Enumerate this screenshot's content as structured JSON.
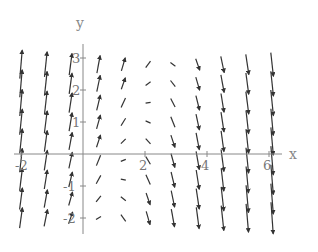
{
  "chart_data": {
    "type": "vector_field",
    "title": "",
    "xlabel": "x",
    "ylabel": "y",
    "xlim": [
      -2.2,
      6.4
    ],
    "ylim": [
      -2.4,
      3.3
    ],
    "x_ticks": [
      -2,
      2,
      4,
      6
    ],
    "y_ticks": [
      -2,
      -1,
      1,
      2,
      3
    ],
    "x_tick_labels": [
      "-2",
      "2",
      "4",
      "6"
    ],
    "y_tick_labels": [
      "-2",
      "-1",
      "1",
      "2",
      "3"
    ],
    "grid": false,
    "legend": null,
    "field_description": "Direction/slope field: steep upward arrows on the left (x<0), near-horizontal arrows around x≈1-3 in upper region, steep downward arrows on the right (x>4), magnitude increasing with distance from center",
    "grid_x": [
      -2.0,
      -1.2,
      -0.4,
      0.5,
      1.3,
      2.1,
      2.9,
      3.7,
      4.5,
      5.3,
      6.1
    ],
    "grid_y": [
      -2.0,
      -1.4,
      -0.8,
      -0.2,
      0.4,
      1.0,
      1.6,
      2.2,
      2.8
    ],
    "arrow_color": "#333333",
    "axis_color": "#888888"
  },
  "axes": {
    "x_label": "x",
    "y_label": "y"
  }
}
